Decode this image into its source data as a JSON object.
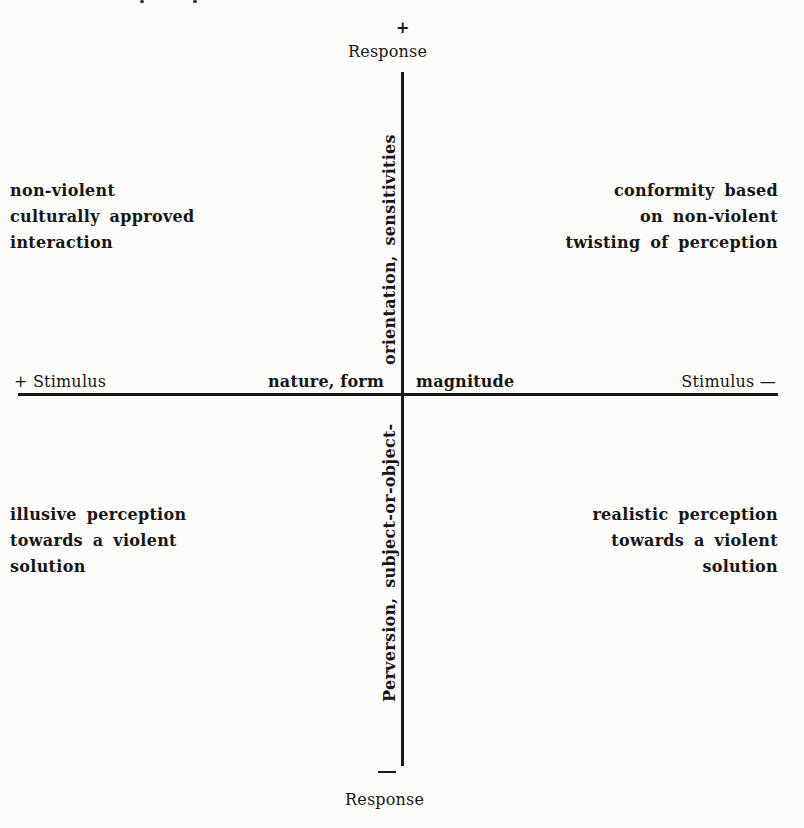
{
  "diagram": {
    "type": "quadrant-axes",
    "vertical_axis": {
      "top_sign": "+",
      "top_label": "Response",
      "bottom_sign": "—",
      "bottom_label": "Response",
      "upper_annotation": "orientation, sensitivities",
      "lower_annotation": "Perversion, subject-or-object-"
    },
    "horizontal_axis": {
      "left_label": "+ Stimulus",
      "right_label": "Stimulus —",
      "left_center_annotation": "nature, form",
      "right_center_annotation": "magnitude"
    },
    "quadrants": {
      "top_left": [
        "non-violent",
        "culturally  approved",
        "interaction"
      ],
      "top_right": [
        "conformity based",
        "on non-violent",
        "twisting of perception"
      ],
      "bottom_left": [
        "illusive perception",
        "towards a violent",
        "solution"
      ],
      "bottom_right": [
        "realistic perception",
        "towards a violent",
        "solution"
      ]
    },
    "colors": {
      "ink": "#161616",
      "paper": "#fbfbf9"
    }
  }
}
